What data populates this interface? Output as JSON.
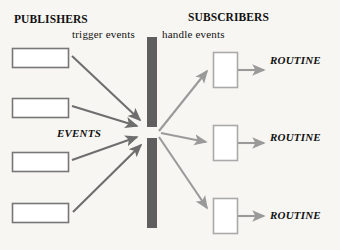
{
  "diagram": {
    "background_color": "#f7f6f3",
    "headings": {
      "publishers": "PUBLISHERS",
      "subscribers": "SUBSCRIBERS"
    },
    "captions": {
      "trigger": "trigger events",
      "handle": "handle events"
    },
    "center_label": "EVENTS",
    "routine_labels": [
      "ROUTINE",
      "ROUTINE",
      "ROUTINE"
    ],
    "colors": {
      "text": "#111111",
      "publisher_box_stroke": "#777777",
      "subscriber_box_stroke": "#aaaaaa",
      "box_fill": "#ffffff",
      "inbound_arrow": "#6e6e6e",
      "outbound_arrow": "#9a9a9a",
      "dispatch_bar": "#5f5f5f"
    },
    "publisher_boxes": [
      {
        "x": 12,
        "y": 48,
        "width": 56,
        "height": 19
      },
      {
        "x": 12,
        "y": 98,
        "width": 56,
        "height": 19
      },
      {
        "x": 12,
        "y": 152,
        "width": 56,
        "height": 19
      },
      {
        "x": 12,
        "y": 203,
        "width": 56,
        "height": 19
      }
    ],
    "subscriber_boxes": [
      {
        "x": 213,
        "y": 52,
        "width": 24,
        "height": 35
      },
      {
        "x": 213,
        "y": 125,
        "width": 24,
        "height": 35
      },
      {
        "x": 213,
        "y": 198,
        "width": 24,
        "height": 35
      }
    ],
    "dispatch_bar": {
      "x": 147,
      "y": 37,
      "width": 10,
      "height": 191,
      "gap_y": 127,
      "gap_height": 11
    },
    "convergence_point": {
      "x": 150,
      "y": 132
    },
    "inbound_arrows": [
      {
        "from_x": 72,
        "from_y": 56,
        "to_x": 143,
        "to_y": 123
      },
      {
        "from_x": 72,
        "from_y": 106,
        "to_x": 140,
        "to_y": 128
      },
      {
        "from_x": 72,
        "from_y": 160,
        "to_x": 140,
        "to_y": 136
      },
      {
        "from_x": 73,
        "from_y": 212,
        "to_x": 144,
        "to_y": 142
      }
    ],
    "outbound_arrows": [
      {
        "from_x": 160,
        "from_y": 132,
        "to_x": 209,
        "to_y": 73
      },
      {
        "from_x": 162,
        "from_y": 133,
        "to_x": 209,
        "to_y": 142
      },
      {
        "from_x": 160,
        "from_y": 138,
        "to_x": 209,
        "to_y": 210
      }
    ],
    "routine_arrows": [
      {
        "from_x": 238,
        "from_y": 70,
        "to_x": 266,
        "to_y": 70
      },
      {
        "from_x": 238,
        "from_y": 143,
        "to_x": 266,
        "to_y": 143
      },
      {
        "from_x": 238,
        "from_y": 216,
        "to_x": 266,
        "to_y": 216
      }
    ]
  }
}
